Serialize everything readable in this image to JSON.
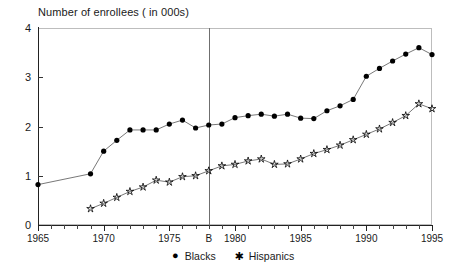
{
  "chart_data": {
    "type": "line",
    "title": "Number of enrollees ( in 000s)",
    "xlabel": "",
    "ylabel": "",
    "xlim": [
      1965,
      1995
    ],
    "ylim": [
      0,
      4
    ],
    "ytick_labels": [
      "0",
      "1",
      "2",
      "3",
      "4"
    ],
    "ytick_values": [
      0,
      1,
      2,
      3,
      4
    ],
    "xtick_values": [
      1965,
      1970,
      1975,
      1978,
      1980,
      1985,
      1990,
      1995
    ],
    "xtick_labels": [
      "1965",
      "1970",
      "1975",
      "B",
      "1980",
      "1985",
      "1990",
      "1995"
    ],
    "grid": false,
    "legend_position": "bottom",
    "annotations": [
      {
        "name": "b-reference-line",
        "type": "vline",
        "x": 1978,
        "label": "B",
        "color": "#6f6f6f"
      }
    ],
    "series": [
      {
        "name": "Blacks",
        "marker": "circle",
        "color": "#000000",
        "x": [
          1965,
          1969,
          1970,
          1971,
          1972,
          1973,
          1974,
          1975,
          1976,
          1977,
          1978,
          1979,
          1980,
          1981,
          1982,
          1983,
          1984,
          1985,
          1986,
          1987,
          1988,
          1989,
          1990,
          1991,
          1992,
          1993,
          1994,
          1995
        ],
        "values": [
          0.82,
          1.04,
          1.5,
          1.72,
          1.93,
          1.93,
          1.93,
          2.05,
          2.13,
          1.97,
          2.03,
          2.05,
          2.18,
          2.22,
          2.25,
          2.21,
          2.25,
          2.17,
          2.16,
          2.32,
          2.42,
          2.55,
          3.02,
          3.18,
          3.33,
          3.47,
          3.6,
          3.46
        ]
      },
      {
        "name": "Hispanics",
        "marker": "star",
        "color": "#000000",
        "x": [
          1969,
          1970,
          1971,
          1972,
          1973,
          1974,
          1975,
          1976,
          1977,
          1978,
          1979,
          1980,
          1981,
          1982,
          1983,
          1984,
          1985,
          1986,
          1987,
          1988,
          1989,
          1990,
          1991,
          1992,
          1993,
          1994,
          1995
        ],
        "values": [
          0.33,
          0.44,
          0.56,
          0.68,
          0.77,
          0.91,
          0.87,
          0.98,
          1.0,
          1.1,
          1.2,
          1.23,
          1.3,
          1.34,
          1.23,
          1.24,
          1.34,
          1.45,
          1.53,
          1.62,
          1.73,
          1.84,
          1.95,
          2.08,
          2.22,
          2.46,
          2.36
        ]
      }
    ]
  },
  "legend": {
    "items": [
      {
        "glyph": "●",
        "label": "Blacks"
      },
      {
        "glyph": "✱",
        "label": "Hispanics"
      }
    ]
  }
}
